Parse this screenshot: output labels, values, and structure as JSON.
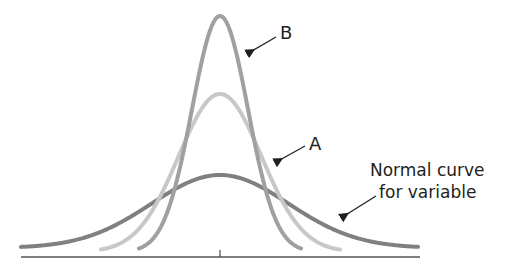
{
  "chart_data": {
    "type": "line",
    "title": "",
    "xlabel": "",
    "ylabel": "",
    "grid": false,
    "legend": "none (curves labeled with arrows)",
    "series": [
      {
        "name": "Normal curve for variable",
        "color": "#808080",
        "shape": "widest, lowest normal curve",
        "center_x_px": 220,
        "peak_y_px": 175,
        "baseline_y_px": 248,
        "x_extent_px": [
          21,
          418
        ],
        "relative_height": 0.31,
        "relative_spread": 1.0
      },
      {
        "name": "A",
        "color": "#c8c8c8",
        "shape": "intermediate normal curve",
        "center_x_px": 220,
        "peak_y_px": 94,
        "baseline_y_px": 252,
        "x_extent_px": [
          101,
          340
        ],
        "relative_height": 0.66,
        "relative_spread": 0.5
      },
      {
        "name": "B",
        "color": "#a0a0a0",
        "shape": "tallest, narrowest normal curve",
        "center_x_px": 220,
        "peak_y_px": 16,
        "baseline_y_px": 252,
        "x_extent_px": [
          139,
          301
        ],
        "relative_height": 1.0,
        "relative_spread": 0.3
      }
    ],
    "axis": {
      "y_px": 257,
      "x_range_px": [
        21,
        420
      ],
      "center_tick_x_px": 220
    },
    "annotations": [
      {
        "text": "B",
        "points_to": "curve B right flank"
      },
      {
        "text": "A",
        "points_to": "curve A right flank"
      },
      {
        "text": "Normal curve\nfor variable",
        "points_to": "wide normal curve right flank"
      }
    ]
  },
  "labels": {
    "b": "B",
    "a": "A",
    "normal_line1": "Normal curve",
    "normal_line2": "for variable"
  },
  "colors": {
    "normal_curve": "#808080",
    "curve_a": "#c8c8c8",
    "curve_b": "#a0a0a0",
    "axis": "#555555",
    "arrow": "#231f20",
    "text": "#231f20"
  }
}
